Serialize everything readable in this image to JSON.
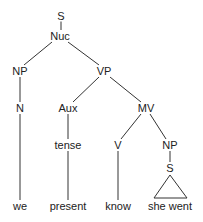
{
  "diagram": {
    "type": "syntax-tree",
    "nodes": {
      "s_root": {
        "label": "S",
        "x": 61,
        "y": 16
      },
      "nuc": {
        "label": "Nuc",
        "x": 60,
        "y": 36
      },
      "np1": {
        "label": "NP",
        "x": 20,
        "y": 71
      },
      "vp": {
        "label": "VP",
        "x": 104,
        "y": 71
      },
      "n": {
        "label": "N",
        "x": 20,
        "y": 108
      },
      "aux": {
        "label": "Aux",
        "x": 68,
        "y": 108
      },
      "mv": {
        "label": "MV",
        "x": 146,
        "y": 108
      },
      "tense": {
        "label": "tense",
        "x": 68,
        "y": 145
      },
      "v": {
        "label": "V",
        "x": 118,
        "y": 145
      },
      "np2": {
        "label": "NP",
        "x": 170,
        "y": 145
      },
      "s_embedded": {
        "label": "S",
        "x": 170,
        "y": 168
      },
      "we": {
        "label": "we",
        "x": 20,
        "y": 206
      },
      "present": {
        "label": "present",
        "x": 68,
        "y": 206
      },
      "know": {
        "label": "know",
        "x": 118,
        "y": 206
      },
      "she_went": {
        "label": "she went",
        "x": 170,
        "y": 206
      }
    },
    "edges": [
      [
        "s_root",
        "nuc"
      ],
      [
        "nuc",
        "np1"
      ],
      [
        "nuc",
        "vp"
      ],
      [
        "np1",
        "n"
      ],
      [
        "n",
        "we"
      ],
      [
        "vp",
        "aux"
      ],
      [
        "vp",
        "mv"
      ],
      [
        "aux",
        "tense"
      ],
      [
        "tense",
        "present"
      ],
      [
        "mv",
        "v"
      ],
      [
        "mv",
        "np2"
      ],
      [
        "v",
        "know"
      ],
      [
        "np2",
        "s_embedded"
      ]
    ],
    "triangle": {
      "apex": [
        170,
        176
      ],
      "base_left": [
        154,
        198
      ],
      "base_right": [
        187,
        198
      ],
      "over": "she_went"
    },
    "colors": {
      "line": "#333333",
      "text": "#222222",
      "background": "#ffffff"
    }
  }
}
